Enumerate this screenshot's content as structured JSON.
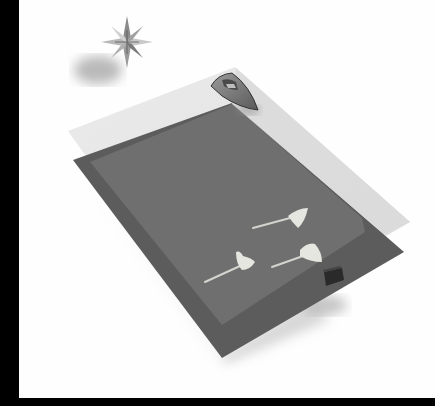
{
  "scene": {
    "description": "Grayscale 3D render: a compass star floating above two stacked translucent planes, with a boat at the top edge, three stingrays and a small dark box on the lower plane",
    "background_color": "#fefefe",
    "frame_color": "#000000",
    "objects": [
      {
        "name": "compass-star",
        "label": "Compass star"
      },
      {
        "name": "upper-plane",
        "label": "Upper translucent plane"
      },
      {
        "name": "lower-plane",
        "label": "Lower plane"
      },
      {
        "name": "boat",
        "label": "Boat"
      },
      {
        "name": "stingray-1",
        "label": "Stingray"
      },
      {
        "name": "stingray-2",
        "label": "Stingray"
      },
      {
        "name": "stingray-3",
        "label": "Stingray"
      },
      {
        "name": "box",
        "label": "Small dark box"
      }
    ],
    "colors": {
      "upper_plane": "#e2e2e2",
      "lower_plane_rim": "#5c5c5c",
      "overlap": "#6f6f6f",
      "stingray": "#d8d8d2",
      "boat_hull": "#6a6a6a",
      "box": "#2a2a2a"
    }
  }
}
